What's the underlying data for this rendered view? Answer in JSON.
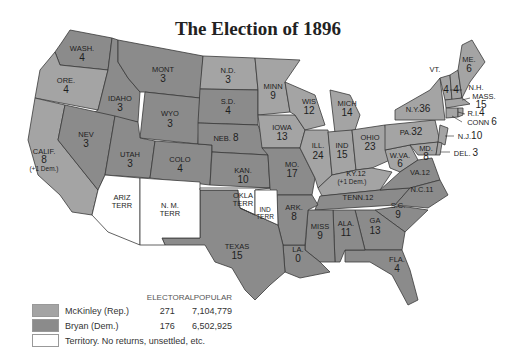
{
  "title": "The Election of 1896",
  "colors": {
    "mckinley": "#a4a4a4",
    "bryan": "#8b8b8b",
    "territory": "#ffffff",
    "border": "#3a3a3a"
  },
  "legend": {
    "header_electoral": "ELECTORAL",
    "header_popular": "POPULAR",
    "entries": [
      {
        "label": "McKinley (Rep.)",
        "electoral": "271",
        "popular": "7,104,779",
        "color_key": "mckinley"
      },
      {
        "label": "Bryan (Dem.)",
        "electoral": "176",
        "popular": "6,502,925",
        "color_key": "bryan"
      },
      {
        "label": "Territory. No returns, unsettled, etc.",
        "electoral": "",
        "popular": "",
        "color_key": "territory"
      }
    ]
  },
  "states": [
    {
      "abbr": "WASH.",
      "electoral": "4",
      "winner": "Bryan"
    },
    {
      "abbr": "ORE.",
      "electoral": "4",
      "winner": "McKinley"
    },
    {
      "abbr": "CALIF.",
      "electoral": "8",
      "note": "(+1 Dem.)",
      "winner": "McKinley"
    },
    {
      "abbr": "IDAHO",
      "electoral": "3",
      "winner": "Bryan"
    },
    {
      "abbr": "NEV",
      "electoral": "3",
      "winner": "Bryan"
    },
    {
      "abbr": "MONT",
      "electoral": "3",
      "winner": "Bryan"
    },
    {
      "abbr": "WYO",
      "electoral": "3",
      "winner": "Bryan"
    },
    {
      "abbr": "UTAH",
      "electoral": "3",
      "winner": "Bryan"
    },
    {
      "abbr": "COLO",
      "electoral": "4",
      "winner": "Bryan"
    },
    {
      "abbr": "N.D.",
      "electoral": "3",
      "winner": "McKinley"
    },
    {
      "abbr": "S.D.",
      "electoral": "4",
      "winner": "Bryan"
    },
    {
      "abbr": "NEB.",
      "electoral": "8",
      "winner": "Bryan"
    },
    {
      "abbr": "KAN.",
      "electoral": "10",
      "winner": "Bryan"
    },
    {
      "abbr": "MINN",
      "electoral": "9",
      "winner": "McKinley"
    },
    {
      "abbr": "IOWA",
      "electoral": "13",
      "winner": "McKinley"
    },
    {
      "abbr": "MO.",
      "electoral": "17",
      "winner": "Bryan"
    },
    {
      "abbr": "WIS",
      "electoral": "12",
      "winner": "McKinley"
    },
    {
      "abbr": "ILL.",
      "electoral": "24",
      "winner": "McKinley"
    },
    {
      "abbr": "MICH",
      "electoral": "14",
      "winner": "McKinley"
    },
    {
      "abbr": "IND",
      "electoral": "15",
      "winner": "McKinley"
    },
    {
      "abbr": "OHIO",
      "electoral": "23",
      "winner": "McKinley"
    },
    {
      "abbr": "KY.",
      "electoral": "12",
      "note": "(+1 Dem.)",
      "winner": "McKinley"
    },
    {
      "abbr": "TENN.",
      "electoral": "12",
      "winner": "Bryan"
    },
    {
      "abbr": "W.VA.",
      "electoral": "6",
      "winner": "McKinley"
    },
    {
      "abbr": "VA.",
      "electoral": "12",
      "winner": "Bryan"
    },
    {
      "abbr": "N.C.",
      "electoral": "11",
      "winner": "Bryan"
    },
    {
      "abbr": "S.C.",
      "electoral": "9",
      "winner": "Bryan"
    },
    {
      "abbr": "GA",
      "electoral": "13",
      "winner": "Bryan"
    },
    {
      "abbr": "FLA.",
      "electoral": "4",
      "winner": "Bryan"
    },
    {
      "abbr": "ALA.",
      "electoral": "11",
      "winner": "Bryan"
    },
    {
      "abbr": "MISS",
      "electoral": "9",
      "winner": "Bryan"
    },
    {
      "abbr": "LA.",
      "electoral": "0",
      "winner": "Bryan"
    },
    {
      "abbr": "ARK.",
      "electoral": "8",
      "winner": "Bryan"
    },
    {
      "abbr": "TEXAS",
      "electoral": "15",
      "winner": "Bryan"
    },
    {
      "abbr": "PA.",
      "electoral": "32",
      "winner": "McKinley"
    },
    {
      "abbr": "N.Y.",
      "electoral": "36",
      "winner": "McKinley"
    },
    {
      "abbr": "VT.",
      "electoral": "4",
      "winner": "McKinley"
    },
    {
      "abbr": "N.H.",
      "electoral": "4",
      "winner": "McKinley"
    },
    {
      "abbr": "ME.",
      "electoral": "6",
      "winner": "McKinley"
    },
    {
      "abbr": "MASS.",
      "electoral": "15",
      "winner": "McKinley"
    },
    {
      "abbr": "R.I.",
      "electoral": "4",
      "winner": "McKinley"
    },
    {
      "abbr": "CONN",
      "electoral": "6",
      "winner": "McKinley"
    },
    {
      "abbr": "N.J.",
      "electoral": "10",
      "winner": "McKinley"
    },
    {
      "abbr": "DEL.",
      "electoral": "3",
      "winner": "McKinley"
    },
    {
      "abbr": "MD.",
      "electoral": "8",
      "winner": "McKinley"
    }
  ],
  "territories": [
    {
      "name": "ARIZ",
      "sub": "TERR"
    },
    {
      "name": "N. M.",
      "sub": "TERR"
    },
    {
      "name": "OKLA",
      "sub": "TERR"
    },
    {
      "name": "IND",
      "sub": "TERR"
    }
  ]
}
